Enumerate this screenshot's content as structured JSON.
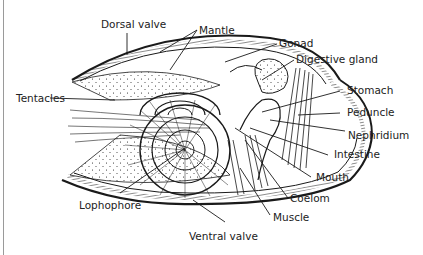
{
  "figure": {
    "labels": {
      "dorsal_valve": "Dorsal valve",
      "mantle": "Mantle",
      "gonad": "Gonad",
      "digestive_gland": "Digestive gland",
      "tentacles": "Tentacles",
      "stomach": "Stomach",
      "peduncle": "Peduncle",
      "nephridium": "Nephridium",
      "intestine": "Intestine",
      "mouth": "Mouth",
      "coelom": "Coelom",
      "muscle": "Muscle",
      "lophophore": "Lophophore",
      "ventral_valve": "Ventral valve"
    },
    "colors": {
      "ink": "#1a1a1a",
      "background": "#ffffff",
      "frame_rule": "#9a9a9a"
    }
  }
}
